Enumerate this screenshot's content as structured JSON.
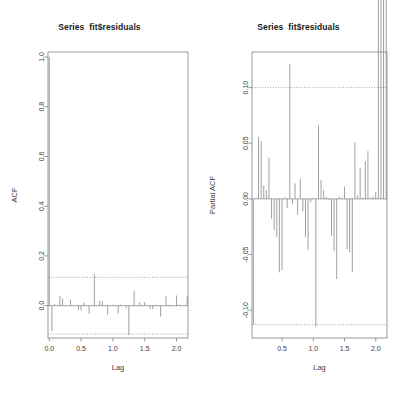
{
  "figure": {
    "background": "#ffffff",
    "line_color": "#808080",
    "text_color": "#3d3d3d",
    "panels": 2
  },
  "chart_data": [
    {
      "type": "bar",
      "title": "Series  fit$residuals",
      "subtitle": "",
      "xlabel": "Lag",
      "ylabel": "ACF",
      "xlim": [
        -0.02,
        2.18
      ],
      "ylim": [
        -0.13,
        1.02
      ],
      "xticks": [
        0.0,
        0.5,
        1.0,
        1.5,
        2.0
      ],
      "xticklabels": [
        "0.0",
        "0.5",
        "1.0",
        "1.5",
        "2.0"
      ],
      "yticks": [
        0.0,
        0.2,
        0.4,
        0.6,
        0.8,
        1.0
      ],
      "yticklabels": [
        "0.0",
        "0.2",
        "0.4",
        "0.6",
        "0.8",
        "1.0"
      ],
      "grid": false,
      "legend": false,
      "zero_line": 0.0,
      "confidence_bounds": [
        0.114,
        -0.114
      ],
      "confidence_style": "dotted",
      "x": [
        0.0,
        0.0417,
        0.0833,
        0.125,
        0.1667,
        0.2083,
        0.25,
        0.2917,
        0.3333,
        0.375,
        0.4167,
        0.4583,
        0.5,
        0.5417,
        0.5833,
        0.625,
        0.6667,
        0.7083,
        0.75,
        0.7917,
        0.8333,
        0.875,
        0.9167,
        0.9583,
        1.0,
        1.0417,
        1.0833,
        1.125,
        1.1667,
        1.2083,
        1.25,
        1.2917,
        1.3333,
        1.375,
        1.4167,
        1.4583,
        1.5,
        1.5417,
        1.5833,
        1.625,
        1.6667,
        1.7083,
        1.75,
        1.7917,
        1.8333,
        1.875,
        1.9167,
        1.9583,
        2.0,
        2.0417,
        2.0833,
        2.125,
        2.1667
      ],
      "values": [
        1.0,
        -0.102,
        0.006,
        0.002,
        0.04,
        0.03,
        -0.001,
        0.001,
        0.025,
        -0.002,
        0.001,
        -0.018,
        -0.02,
        0.012,
        0.001,
        -0.033,
        0.002,
        0.128,
        -0.002,
        0.02,
        0.018,
        -0.001,
        -0.036,
        0.001,
        0.003,
        0.002,
        -0.031,
        0.004,
        0.001,
        -0.01,
        -0.118,
        0.001,
        0.06,
        0.002,
        0.014,
        -0.002,
        0.015,
        0.002,
        -0.013,
        -0.014,
        -0.001,
        0.002,
        -0.044,
        0.001,
        0.038,
        -0.003,
        0.002,
        0.001,
        0.041,
        0.004,
        0.001,
        0.002,
        0.036
      ]
    },
    {
      "type": "bar",
      "title": "Series  fit$residuals",
      "subtitle": "",
      "xlabel": "Lag",
      "ylabel": "Partial ACF",
      "xlim": [
        0.02,
        2.18
      ],
      "ylim": [
        -0.125,
        0.132
      ],
      "xticks": [
        0.5,
        1.0,
        1.5,
        2.0
      ],
      "xticklabels": [
        "0.5",
        "1.0",
        "1.5",
        "2.0"
      ],
      "yticks": [
        -0.1,
        -0.05,
        0.0,
        0.05,
        0.1
      ],
      "yticklabels": [
        "-0.10",
        "-0.05",
        "0.00",
        "0.05",
        "0.10"
      ],
      "grid": false,
      "legend": false,
      "zero_line": 0.0,
      "confidence_bounds": [
        0.1,
        -0.113
      ],
      "confidence_style": "dotted",
      "x": [
        0.0417,
        0.0833,
        0.125,
        0.1667,
        0.2083,
        0.25,
        0.2917,
        0.3333,
        0.375,
        0.4167,
        0.4583,
        0.5,
        0.5417,
        0.5833,
        0.625,
        0.6667,
        0.7083,
        0.75,
        0.7917,
        0.8333,
        0.875,
        0.9167,
        0.9583,
        1.0,
        1.0417,
        1.0833,
        1.125,
        1.1667,
        1.2083,
        1.25,
        1.2917,
        1.3333,
        1.375,
        1.4167,
        1.4583,
        1.5,
        1.5417,
        1.5833,
        1.625,
        1.6667,
        1.7083,
        1.75,
        1.7917,
        1.8333,
        1.875,
        1.9167,
        1.9583,
        2.0,
        2.0417,
        2.0833,
        2.125,
        2.1667
      ],
      "values": [
        -0.113,
        0.001,
        0.056,
        0.052,
        0.012,
        0.008,
        0.037,
        -0.018,
        -0.028,
        -0.034,
        -0.066,
        -0.064,
        0.001,
        -0.008,
        0.121,
        -0.005,
        0.014,
        -0.014,
        0.018,
        -0.011,
        -0.034,
        -0.046,
        -0.003,
        0.001,
        -0.115,
        0.066,
        0.017,
        0.008,
        0.002,
        -0.001,
        -0.033,
        -0.047,
        -0.072,
        0.002,
        0.001,
        0.011,
        -0.045,
        -0.048,
        -0.066,
        0.051,
        0.003,
        0.028,
        0.001,
        0.034,
        0.043,
        0.001,
        0.002,
        0.006
      ]
    }
  ]
}
